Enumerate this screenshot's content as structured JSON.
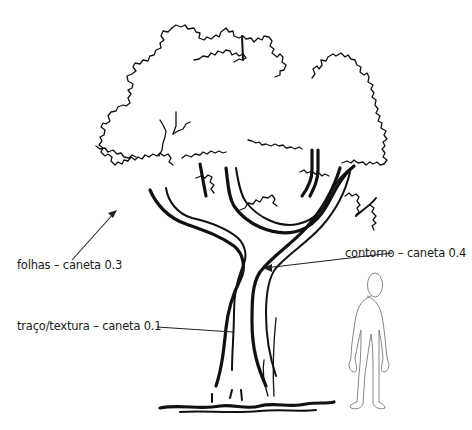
{
  "illustration": {
    "subject": "tree-with-human-scale-figure",
    "colors": {
      "ink": "#111111",
      "figure": "#777777",
      "background": "#ffffff"
    }
  },
  "labels": {
    "leaves": "folhas – caneta 0.3",
    "outline": "contorno – caneta 0.4",
    "texture": "traço/textura – caneta 0.1"
  }
}
